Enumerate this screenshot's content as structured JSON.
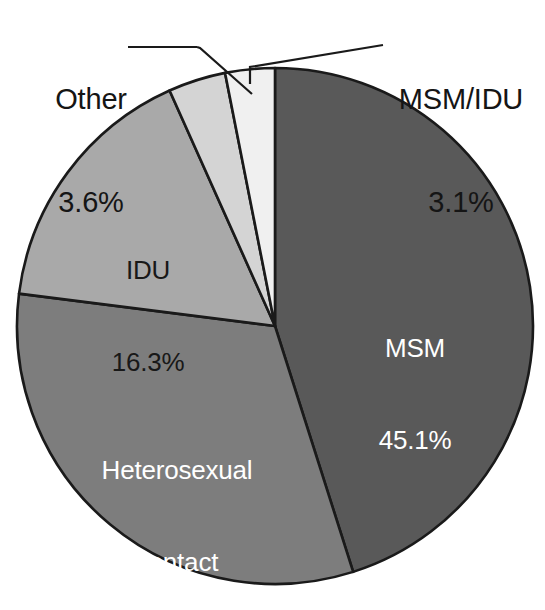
{
  "chart_data": {
    "type": "pie",
    "title": "",
    "subtitle": "",
    "xlabel": "",
    "ylabel": "",
    "legend_position": "none",
    "grid": false,
    "start_angle_deg": 0,
    "direction": "clockwise",
    "categories": [
      "MSM",
      "Heterosexual contact",
      "IDU",
      "Other",
      "MSM/IDU"
    ],
    "values": [
      45.1,
      31.9,
      16.3,
      3.6,
      3.1
    ],
    "value_unit": "%",
    "colors": [
      "#595959",
      "#7d7d7d",
      "#a9a9a9",
      "#d4d4d4",
      "#f0f0f0"
    ],
    "slices": [
      {
        "name": "MSM",
        "label": "MSM",
        "value": 45.1,
        "value_label": "45.1%",
        "color": "#595959",
        "label_placement": "inside",
        "label_color": "#ffffff",
        "leader_line": false
      },
      {
        "name": "Heterosexual contact",
        "label_line1": "Heterosexual",
        "label_line2": "contact",
        "value": 31.9,
        "value_label": "31.9%",
        "color": "#7d7d7d",
        "label_placement": "inside",
        "label_color": "#ffffff",
        "leader_line": false
      },
      {
        "name": "IDU",
        "label": "IDU",
        "value": 16.3,
        "value_label": "16.3%",
        "color": "#a9a9a9",
        "label_placement": "inside",
        "label_color": "#181818",
        "leader_line": false
      },
      {
        "name": "Other",
        "label": "Other",
        "value": 3.6,
        "value_label": "3.6%",
        "color": "#d4d4d4",
        "label_placement": "outside-left",
        "label_color": "#151515",
        "leader_line": true
      },
      {
        "name": "MSM/IDU",
        "label": "MSM/IDU",
        "value": 3.1,
        "value_label": "3.1%",
        "color": "#f0f0f0",
        "label_placement": "outside-right",
        "label_color": "#151515",
        "leader_line": true
      }
    ],
    "outline_color": "#1a1a1a",
    "background": "#ffffff"
  },
  "labels": {
    "other": {
      "name": "Other",
      "pct": "3.6%"
    },
    "msm_idu": {
      "name": "MSM/IDU",
      "pct": "3.1%"
    },
    "idu": {
      "name": "IDU",
      "pct": "16.3%"
    },
    "msm": {
      "name": "MSM",
      "pct": "45.1%"
    },
    "hetero": {
      "name_line1": "Heterosexual",
      "name_line2": "contact",
      "pct": "31.9%"
    }
  }
}
